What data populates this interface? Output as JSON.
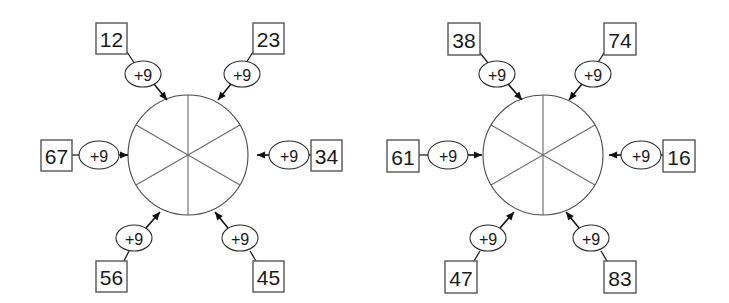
{
  "worksheet": {
    "background_color": "#ffffff",
    "stroke_color": "#1f1f1f",
    "diagram_count": 2
  },
  "diagrams": [
    {
      "name": "addition-wheel-left",
      "wheel": {
        "sector_count": 6,
        "center_x": 188,
        "center_y": 155,
        "radius": 60
      },
      "spokes": [
        {
          "position": "top-left",
          "operation": "+9",
          "value": "12",
          "box": {
            "x": 96,
            "y": 23,
            "w": 31,
            "h": 31
          },
          "ellipse": {
            "cx": 143,
            "cy": 74,
            "rx": 18,
            "ry": 13
          },
          "arrow": {
            "x1": 154,
            "y1": 84,
            "x2": 167,
            "y2": 100
          },
          "connector": {
            "x1": 127,
            "y1": 52,
            "x2": 135,
            "y2": 64
          },
          "direction": "into-wheel"
        },
        {
          "position": "top-right",
          "operation": "+9",
          "value": "23",
          "box": {
            "x": 253,
            "y": 23,
            "w": 31,
            "h": 31
          },
          "ellipse": {
            "cx": 242,
            "cy": 74,
            "rx": 18,
            "ry": 13
          },
          "arrow": {
            "x1": 231,
            "y1": 84,
            "x2": 218,
            "y2": 100
          },
          "connector": {
            "x1": 253,
            "y1": 52,
            "x2": 246,
            "y2": 63
          },
          "direction": "into-wheel"
        },
        {
          "position": "left",
          "operation": "+9",
          "value": "67",
          "box": {
            "x": 41,
            "y": 140,
            "w": 31,
            "h": 31
          },
          "ellipse": {
            "cx": 99,
            "cy": 155,
            "rx": 20,
            "ry": 14
          },
          "arrow": {
            "x1": 119,
            "y1": 155,
            "x2": 128,
            "y2": 155
          },
          "connector": {
            "x1": 72,
            "y1": 155,
            "x2": 79,
            "y2": 155
          },
          "direction": "into-wheel"
        },
        {
          "position": "right",
          "operation": "+9",
          "value": "34",
          "box": {
            "x": 311,
            "y": 140,
            "w": 31,
            "h": 31
          },
          "ellipse": {
            "cx": 289,
            "cy": 155,
            "rx": 20,
            "ry": 14
          },
          "arrow": {
            "x1": 269,
            "y1": 155,
            "x2": 257,
            "y2": 155
          },
          "connector": {
            "x1": 311,
            "y1": 155,
            "x2": 309,
            "y2": 155
          },
          "direction": "into-wheel"
        },
        {
          "position": "bottom-left",
          "operation": "+9",
          "value": "56",
          "box": {
            "x": 96,
            "y": 261,
            "w": 31,
            "h": 31
          },
          "ellipse": {
            "cx": 134,
            "cy": 238,
            "rx": 18,
            "ry": 13
          },
          "arrow": {
            "x1": 146,
            "y1": 228,
            "x2": 160,
            "y2": 212
          },
          "connector": {
            "x1": 124,
            "y1": 261,
            "x2": 129,
            "y2": 251
          },
          "direction": "into-wheel"
        },
        {
          "position": "bottom-right",
          "operation": "+9",
          "value": "45",
          "box": {
            "x": 253,
            "y": 261,
            "w": 31,
            "h": 31
          },
          "ellipse": {
            "cx": 240,
            "cy": 238,
            "rx": 18,
            "ry": 13
          },
          "arrow": {
            "x1": 228,
            "y1": 228,
            "x2": 215,
            "y2": 212
          },
          "connector": {
            "x1": 256,
            "y1": 261,
            "x2": 250,
            "y2": 251
          },
          "direction": "into-wheel"
        }
      ]
    },
    {
      "name": "addition-wheel-right",
      "wheel": {
        "sector_count": 6,
        "center_x": 179,
        "center_y": 155,
        "radius": 60
      },
      "spokes": [
        {
          "position": "top-left",
          "operation": "+9",
          "value": "38",
          "box": {
            "x": 84,
            "y": 23,
            "w": 32,
            "h": 32
          },
          "ellipse": {
            "cx": 133,
            "cy": 74,
            "rx": 18,
            "ry": 13
          },
          "arrow": {
            "x1": 144,
            "y1": 84,
            "x2": 158,
            "y2": 100
          },
          "connector": {
            "x1": 116,
            "y1": 53,
            "x2": 125,
            "y2": 64
          },
          "direction": "into-wheel"
        },
        {
          "position": "top-right",
          "operation": "+9",
          "value": "74",
          "box": {
            "x": 240,
            "y": 23,
            "w": 32,
            "h": 32
          },
          "ellipse": {
            "cx": 229,
            "cy": 74,
            "rx": 18,
            "ry": 13
          },
          "arrow": {
            "x1": 218,
            "y1": 84,
            "x2": 205,
            "y2": 100
          },
          "connector": {
            "x1": 240,
            "y1": 53,
            "x2": 233,
            "y2": 64
          },
          "direction": "into-wheel"
        },
        {
          "position": "left",
          "operation": "+9",
          "value": "61",
          "box": {
            "x": 23,
            "y": 140,
            "w": 32,
            "h": 32
          },
          "ellipse": {
            "cx": 84,
            "cy": 155,
            "rx": 20,
            "ry": 14
          },
          "arrow": {
            "x1": 104,
            "y1": 155,
            "x2": 118,
            "y2": 155
          },
          "connector": {
            "x1": 55,
            "y1": 155,
            "x2": 64,
            "y2": 155
          },
          "direction": "into-wheel"
        },
        {
          "position": "right",
          "operation": "+9",
          "value": "16",
          "box": {
            "x": 299,
            "y": 140,
            "w": 32,
            "h": 32
          },
          "ellipse": {
            "cx": 277,
            "cy": 155,
            "rx": 20,
            "ry": 14
          },
          "arrow": {
            "x1": 257,
            "y1": 155,
            "x2": 245,
            "y2": 155
          },
          "connector": {
            "x1": 299,
            "y1": 155,
            "x2": 297,
            "y2": 155
          },
          "direction": "into-wheel"
        },
        {
          "position": "bottom-left",
          "operation": "+9",
          "value": "47",
          "box": {
            "x": 81,
            "y": 261,
            "w": 32,
            "h": 32
          },
          "ellipse": {
            "cx": 124,
            "cy": 238,
            "rx": 18,
            "ry": 13
          },
          "arrow": {
            "x1": 136,
            "y1": 228,
            "x2": 150,
            "y2": 212
          },
          "connector": {
            "x1": 110,
            "y1": 261,
            "x2": 116,
            "y2": 251
          },
          "direction": "into-wheel"
        },
        {
          "position": "bottom-right",
          "operation": "+9",
          "value": "83",
          "box": {
            "x": 240,
            "y": 261,
            "w": 32,
            "h": 32
          },
          "ellipse": {
            "cx": 227,
            "cy": 238,
            "rx": 18,
            "ry": 13
          },
          "arrow": {
            "x1": 215,
            "y1": 228,
            "x2": 202,
            "y2": 212
          },
          "connector": {
            "x1": 243,
            "y1": 261,
            "x2": 237,
            "y2": 251
          },
          "direction": "into-wheel"
        }
      ]
    }
  ]
}
